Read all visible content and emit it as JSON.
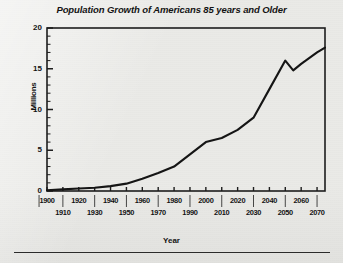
{
  "figure": {
    "background_color": "#eaeae7",
    "ink_color": "#1a1a1a"
  },
  "chart_data": {
    "type": "line",
    "title": "Population Growth of Americans 85 years and Older",
    "xlabel": "Year",
    "ylabel": "Millions",
    "xlim": [
      1900,
      2075
    ],
    "ylim": [
      0,
      20
    ],
    "grid": false,
    "legend": "none",
    "y_ticks_major": [
      0,
      5,
      10,
      15,
      20
    ],
    "y_ticks_minor_step": 1,
    "x_ticks_major": [
      1900,
      1920,
      1940,
      1960,
      1980,
      2000,
      2020,
      2040,
      2060
    ],
    "x_ticks_minor": [
      1910,
      1930,
      1950,
      1970,
      1990,
      2010,
      2030,
      2050,
      2070
    ],
    "x_tick_labels_row1": [
      "1900",
      "1920",
      "1940",
      "1960",
      "1980",
      "2000",
      "2020",
      "2040",
      "2060"
    ],
    "x_tick_labels_row2": [
      "1910",
      "1930",
      "1950",
      "1970",
      "1990",
      "2010",
      "2030",
      "2050",
      "2070"
    ],
    "y_tick_labels": [
      "0",
      "5",
      "10",
      "15",
      "20"
    ],
    "series": [
      {
        "name": "Americans 85 years and older",
        "x": [
          1900,
          1910,
          1920,
          1930,
          1940,
          1950,
          1960,
          1970,
          1980,
          1990,
          2000,
          2010,
          2020,
          2030,
          2040,
          2050,
          2055,
          2060,
          2070,
          2075
        ],
        "values": [
          0.1,
          0.2,
          0.3,
          0.4,
          0.6,
          0.9,
          1.5,
          2.2,
          3.0,
          4.5,
          6.0,
          6.5,
          7.5,
          9.0,
          12.5,
          16.0,
          14.8,
          15.6,
          17.0,
          17.6
        ]
      }
    ]
  }
}
